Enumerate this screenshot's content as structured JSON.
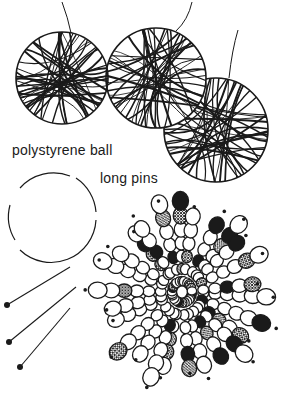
{
  "illustration": {
    "subject": "craft illustration of string balls and bead ball",
    "labels": {
      "polystyrene_ball": "polystyrene ball",
      "long_pins": "long pins"
    },
    "colors": {
      "ink": "#1a1a1a",
      "paper": "#ffffff"
    },
    "string_balls": [
      {
        "cx": 62,
        "cy": 78,
        "r": 46
      },
      {
        "cx": 156,
        "cy": 78,
        "r": 50
      },
      {
        "cx": 216,
        "cy": 130,
        "r": 52
      }
    ],
    "polystyrene_ball": {
      "cx": 52,
      "cy": 218,
      "r": 45
    },
    "pins": [
      {
        "head_x": 7,
        "head_y": 305,
        "tip_x": 70,
        "tip_y": 267
      },
      {
        "head_x": 9,
        "head_y": 342,
        "tip_x": 76,
        "tip_y": 287
      },
      {
        "head_x": 20,
        "head_y": 367,
        "tip_x": 70,
        "tip_y": 308
      }
    ],
    "bead_ball": {
      "cx": 182,
      "cy": 292,
      "r": 95
    }
  }
}
